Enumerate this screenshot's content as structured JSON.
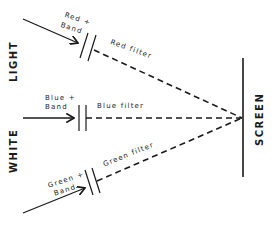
{
  "diagram": {
    "side_label_top": "LIGHT",
    "side_label_bottom": "WHITE",
    "screen_label": "SCREEN",
    "beams": [
      {
        "name": "red",
        "input_label_line1": "Red +",
        "input_label_line2": "Band",
        "filter_label": "Red filter"
      },
      {
        "name": "blue",
        "input_label_line1": "Blue +",
        "input_label_line2": "Band",
        "filter_label": "Blue filter"
      },
      {
        "name": "green",
        "input_label_line1": "Green +",
        "input_label_line2": "Band",
        "filter_label": "Green filter"
      }
    ],
    "colors": {
      "ink": "#1a1a1a",
      "background": "#ffffff"
    }
  }
}
